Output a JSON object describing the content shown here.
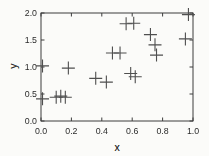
{
  "colors": {
    "background": "#fbfbf9",
    "frame": "#3d3d3d",
    "tick_text": "#2b2b2b",
    "marker": "#4f4f4f"
  },
  "chart_data": {
    "type": "scatter",
    "title": "",
    "xlabel": "x",
    "ylabel": "y",
    "xlim": [
      0.0,
      1.0
    ],
    "ylim": [
      0.0,
      2.0
    ],
    "xticks": [
      0.0,
      0.2,
      0.4,
      0.6,
      0.8,
      1.0
    ],
    "yticks": [
      0.0,
      0.5,
      1.0,
      1.5,
      2.0
    ],
    "xtick_labels": [
      "0.0",
      "0.2",
      "0.4",
      "0.6",
      "0.8",
      "1.0"
    ],
    "ytick_labels": [
      "0.0",
      "0.5",
      "1.0",
      "1.5",
      "2.0"
    ],
    "grid": false,
    "legend": null,
    "marker": "plus",
    "marker_size": 13,
    "points": [
      {
        "x": 0.01,
        "y": 1.02
      },
      {
        "x": 0.18,
        "y": 0.98
      },
      {
        "x": 0.01,
        "y": 0.41
      },
      {
        "x": 0.1,
        "y": 0.44
      },
      {
        "x": 0.13,
        "y": 0.46
      },
      {
        "x": 0.16,
        "y": 0.44
      },
      {
        "x": 0.36,
        "y": 0.79
      },
      {
        "x": 0.43,
        "y": 0.72
      },
      {
        "x": 0.47,
        "y": 1.26
      },
      {
        "x": 0.52,
        "y": 1.26
      },
      {
        "x": 0.56,
        "y": 1.8
      },
      {
        "x": 0.61,
        "y": 1.81
      },
      {
        "x": 0.59,
        "y": 0.88
      },
      {
        "x": 0.62,
        "y": 0.82
      },
      {
        "x": 0.72,
        "y": 1.6
      },
      {
        "x": 0.75,
        "y": 1.41
      },
      {
        "x": 0.76,
        "y": 1.22
      },
      {
        "x": 0.95,
        "y": 1.52
      },
      {
        "x": 0.97,
        "y": 1.97
      }
    ]
  }
}
